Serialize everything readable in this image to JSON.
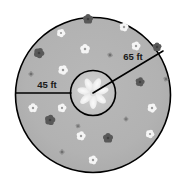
{
  "figure": {
    "background_color": "#ffffff"
  },
  "outer_circle": {
    "name": "outer-garden-circle",
    "cx": 93,
    "cy": 95,
    "r": 77.5,
    "fill_color": "#b3b3b3",
    "stroke_color": "#000000",
    "stroke_width": 1.6
  },
  "inner_circle": {
    "name": "inner-flower-bed-circle",
    "cx": 93,
    "cy": 93,
    "r": 22.5,
    "fill_color": "#c9c9c9",
    "stroke_color": "#000000",
    "stroke_width": 1.6
  },
  "dimensions": {
    "outer_radius": {
      "label": "65 ft",
      "line": {
        "x1": 93,
        "y1": 93,
        "x2": 163,
        "y2": 51
      },
      "label_x": 133,
      "label_y": 60,
      "stroke_color": "#000000",
      "stroke_width": 1.6
    },
    "annulus_width": {
      "label": "45 ft",
      "line": {
        "x1": 16,
        "y1": 93,
        "x2": 71,
        "y2": 93
      },
      "label_x": 47,
      "label_y": 88,
      "stroke_color": "#000000",
      "stroke_width": 1.6
    }
  },
  "center_flower": {
    "name": "center-pinwheel-flower",
    "cx": 93,
    "cy": 93,
    "petal_count": 7,
    "petal_length": 17,
    "petal_width": 7.5,
    "color": "#f2f2f2",
    "core_color": "#dcdcdc"
  },
  "flower_colors": {
    "white": "#f5f5f5",
    "dark": "#595959",
    "mid": "#8a8a8a"
  },
  "flowers": [
    {
      "cx": 88,
      "cy": 19,
      "r": 5.0,
      "tone": "dark"
    },
    {
      "cx": 124,
      "cy": 27,
      "r": 4.5,
      "tone": "white"
    },
    {
      "cx": 61,
      "cy": 33,
      "r": 4.2,
      "tone": "white"
    },
    {
      "cx": 85,
      "cy": 49,
      "r": 4.8,
      "tone": "white"
    },
    {
      "cx": 136,
      "cy": 46,
      "r": 4.5,
      "tone": "white"
    },
    {
      "cx": 39,
      "cy": 53,
      "r": 5.2,
      "tone": "dark"
    },
    {
      "cx": 157,
      "cy": 47,
      "r": 4.5,
      "tone": "dark"
    },
    {
      "cx": 110,
      "cy": 55,
      "r": 2.6,
      "tone": "mid"
    },
    {
      "cx": 63,
      "cy": 70,
      "r": 4.8,
      "tone": "white"
    },
    {
      "cx": 31,
      "cy": 74,
      "r": 2.6,
      "tone": "mid"
    },
    {
      "cx": 140,
      "cy": 82,
      "r": 4.6,
      "tone": "dark"
    },
    {
      "cx": 166,
      "cy": 79,
      "r": 2.6,
      "tone": "mid"
    },
    {
      "cx": 33,
      "cy": 108,
      "r": 4.6,
      "tone": "white"
    },
    {
      "cx": 62,
      "cy": 108,
      "r": 4.4,
      "tone": "white"
    },
    {
      "cx": 152,
      "cy": 108,
      "r": 4.6,
      "tone": "white"
    },
    {
      "cx": 126,
      "cy": 119,
      "r": 2.4,
      "tone": "mid"
    },
    {
      "cx": 50,
      "cy": 120,
      "r": 5.2,
      "tone": "dark"
    },
    {
      "cx": 78,
      "cy": 126,
      "r": 2.4,
      "tone": "mid"
    },
    {
      "cx": 108,
      "cy": 138,
      "r": 5.0,
      "tone": "dark"
    },
    {
      "cx": 81,
      "cy": 136,
      "r": 4.6,
      "tone": "white"
    },
    {
      "cx": 150,
      "cy": 134,
      "r": 4.3,
      "tone": "white"
    },
    {
      "cx": 62,
      "cy": 152,
      "r": 2.6,
      "tone": "mid"
    },
    {
      "cx": 93,
      "cy": 160,
      "r": 4.5,
      "tone": "white"
    }
  ]
}
